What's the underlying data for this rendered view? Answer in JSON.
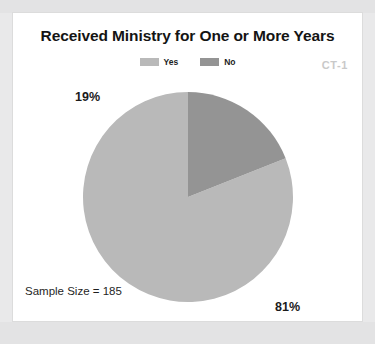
{
  "card": {
    "title": "Received Ministry for One or More Years",
    "corner_code": "CT-1",
    "sample_size_text": "Sample Size = 185"
  },
  "legend": {
    "items": [
      {
        "label": "Yes",
        "color": "#b9b9b9",
        "swatch_name": "legend-swatch-yes"
      },
      {
        "label": "No",
        "color": "#949494",
        "swatch_name": "legend-swatch-no"
      }
    ]
  },
  "labels": {
    "no_pct": "19%",
    "yes_pct": "81%"
  },
  "colors": {
    "yes": "#b9b9b9",
    "no": "#949494",
    "card_background": "#ffffff",
    "page_background": "#e9e9ea",
    "title_text": "#141414",
    "corner_code_text": "#c9c9c9"
  },
  "chart_data": {
    "type": "pie",
    "title": "Received Ministry for One or More Years",
    "subtitle": "",
    "categories": [
      "Yes",
      "No"
    ],
    "values": [
      81,
      19
    ],
    "value_labels": [
      "81%",
      "19%"
    ],
    "units": "percent",
    "sample_size": 185,
    "colors": [
      "#b9b9b9",
      "#949494"
    ],
    "legend": {
      "entries": [
        "Yes",
        "No"
      ],
      "position": "top-center"
    },
    "annotations": [
      "Sample Size = 185",
      "CT-1"
    ],
    "start_angle_deg": 0,
    "direction": "counterclockwise",
    "grid": false
  }
}
